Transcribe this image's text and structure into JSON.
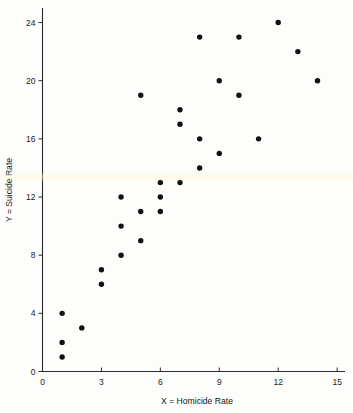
{
  "chart_data": {
    "type": "scatter",
    "title": "",
    "xlabel": "X = Homicide Rate",
    "ylabel": "Y = Suicide Rate",
    "xlim": [
      0,
      15.4
    ],
    "ylim": [
      0,
      25
    ],
    "xticks": [
      0,
      3,
      6,
      9,
      12,
      15
    ],
    "xtick_labels": [
      "0",
      "3",
      "6",
      "9",
      "12",
      "15"
    ],
    "yticks": [
      0,
      4,
      8,
      12,
      16,
      20,
      24
    ],
    "ytick_labels": [
      "0",
      "4",
      "8",
      "12",
      "16",
      "20",
      "24"
    ],
    "grid": false,
    "legend": null,
    "marker": "filled-circle",
    "marker_color": "#111111",
    "points": [
      {
        "x": 1,
        "y": 1
      },
      {
        "x": 1,
        "y": 2
      },
      {
        "x": 1,
        "y": 4
      },
      {
        "x": 2,
        "y": 3
      },
      {
        "x": 3,
        "y": 6
      },
      {
        "x": 3,
        "y": 7
      },
      {
        "x": 4,
        "y": 8
      },
      {
        "x": 4,
        "y": 10
      },
      {
        "x": 4,
        "y": 12
      },
      {
        "x": 5,
        "y": 9
      },
      {
        "x": 5,
        "y": 11
      },
      {
        "x": 5,
        "y": 19
      },
      {
        "x": 6,
        "y": 11
      },
      {
        "x": 6,
        "y": 12
      },
      {
        "x": 6,
        "y": 13
      },
      {
        "x": 7,
        "y": 13
      },
      {
        "x": 7,
        "y": 17
      },
      {
        "x": 7,
        "y": 18
      },
      {
        "x": 8,
        "y": 14
      },
      {
        "x": 8,
        "y": 16
      },
      {
        "x": 8,
        "y": 23
      },
      {
        "x": 9,
        "y": 15
      },
      {
        "x": 9,
        "y": 20
      },
      {
        "x": 10,
        "y": 19
      },
      {
        "x": 10,
        "y": 23
      },
      {
        "x": 11,
        "y": 16
      },
      {
        "x": 12,
        "y": 24
      },
      {
        "x": 13,
        "y": 22
      },
      {
        "x": 14,
        "y": 20
      }
    ]
  },
  "axes": {
    "x_axis_name": "homicide-rate-axis",
    "y_axis_name": "suicide-rate-axis"
  }
}
